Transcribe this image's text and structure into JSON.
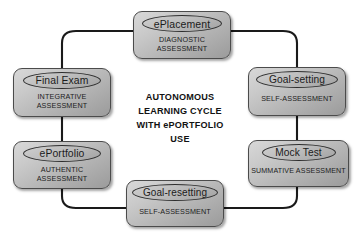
{
  "diagram": {
    "title_center": "AUTONOMOUS\nLEARNING CYCLE\nWITH ePORTFOLIO\nUSE",
    "background_color": "#ffffff",
    "node_fill_color": "#bdbdbd",
    "node_border_color": "#4b4b4b",
    "connector_color": "#1a1a1a",
    "nodes": [
      {
        "id": "eplacement",
        "label": "ePlacement",
        "subtitle": "DIAGNOSTIC\nASSESSMENT",
        "position": "top"
      },
      {
        "id": "goalsetting",
        "label": "Goal-setting",
        "subtitle": "SELF-ASSESSMENT",
        "position": "right-upper"
      },
      {
        "id": "mocktest",
        "label": "Mock Test",
        "subtitle": "SUMMATIVE ASSESSMENT",
        "position": "right-lower"
      },
      {
        "id": "goalresetting",
        "label": "Goal-resetting",
        "subtitle": "SELF-ASSESSMENT",
        "position": "bottom"
      },
      {
        "id": "eportfolio",
        "label": "ePortfolio",
        "subtitle": "AUTHENTIC\nASSESSMENT",
        "position": "left-lower"
      },
      {
        "id": "finalexam",
        "label": "Final Exam",
        "subtitle": "INTEGRATIVE\nASSESSMENT",
        "position": "left-upper"
      }
    ],
    "connections": [
      {
        "from": "eplacement",
        "to": "goalsetting"
      },
      {
        "from": "goalsetting",
        "to": "mocktest"
      },
      {
        "from": "mocktest",
        "to": "goalresetting"
      },
      {
        "from": "goalresetting",
        "to": "eportfolio"
      },
      {
        "from": "eportfolio",
        "to": "finalexam"
      },
      {
        "from": "finalexam",
        "to": "eplacement"
      }
    ]
  }
}
